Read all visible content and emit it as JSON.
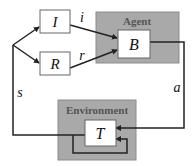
{
  "diagram": {
    "type": "reinforcement-learning-loop",
    "colors": {
      "line": "#222222",
      "container_fill": "#a9a9a9",
      "container_stroke": "#8c8c8c",
      "box_fill": "#ffffff",
      "box_stroke": "#666666",
      "title_text": "#555555"
    },
    "nodes": {
      "input": {
        "label": "I"
      },
      "reinforcement": {
        "label": "R"
      },
      "agent": {
        "title": "Agent",
        "inner_label": "B"
      },
      "environment": {
        "title": "Environment",
        "inner_label": "T"
      }
    },
    "edges": {
      "i": {
        "label": "i",
        "from": "I",
        "to": "B"
      },
      "r": {
        "label": "r",
        "from": "R",
        "to": "B"
      },
      "a": {
        "label": "a",
        "from": "B",
        "to": "T"
      },
      "s": {
        "label": "s",
        "from": "T",
        "to": [
          "I",
          "R"
        ]
      },
      "self": {
        "label": "",
        "from": "T",
        "to": "T"
      }
    }
  }
}
